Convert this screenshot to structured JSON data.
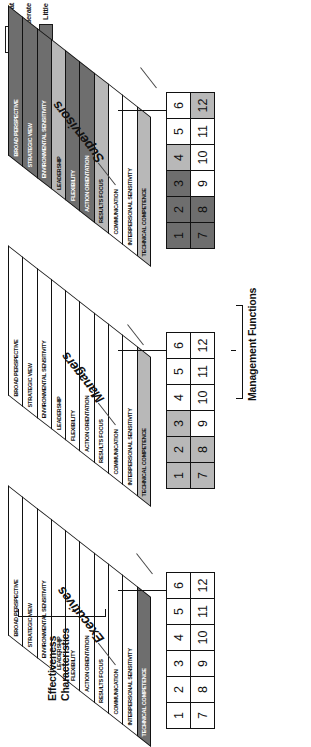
{
  "figure": {
    "effectiveness_label_line1": "Effectiveness",
    "effectiveness_label_line2": "Characteristics",
    "management_functions_label": "Management Functions"
  },
  "legend": {
    "title": "",
    "items": [
      {
        "label": "Great",
        "color": "#ffffff",
        "level": "great"
      },
      {
        "label": "Moderate",
        "color": "#b8b8b8",
        "level": "moderate"
      },
      {
        "label": "Little",
        "color": "#6e6e6e",
        "level": "little"
      }
    ]
  },
  "characteristics": [
    "BROAD PERSPECTIVE",
    "STRATEGIC VIEW",
    "ENVIRONMENTAL SENSITIVITY",
    "LEADERSHIP",
    "FLEXIBILITY",
    "ACTION ORIENTATION",
    "RESULTS FOCUS",
    "COMMUNICATION",
    "INTERPERSONAL SENSITIVITY",
    "TECHNICAL COMPETENCE"
  ],
  "grid_numbers": [
    [
      1,
      2,
      3,
      4,
      5,
      6
    ],
    [
      7,
      8,
      9,
      10,
      11,
      12
    ]
  ],
  "panels": [
    {
      "id": "executives",
      "title": "Executives",
      "band_levels": [
        "great",
        "great",
        "great",
        "great",
        "great",
        "great",
        "great",
        "great",
        "great",
        "little"
      ],
      "grid_levels": [
        [
          "great",
          "great",
          "great",
          "great",
          "great",
          "great"
        ],
        [
          "great",
          "great",
          "great",
          "great",
          "great",
          "great"
        ]
      ]
    },
    {
      "id": "managers",
      "title": "Managers",
      "band_levels": [
        "great",
        "great",
        "great",
        "great",
        "great",
        "great",
        "great",
        "great",
        "great",
        "moderate"
      ],
      "grid_levels": [
        [
          "moderate",
          "moderate",
          "moderate",
          "great",
          "great",
          "great"
        ],
        [
          "moderate",
          "moderate",
          "great",
          "great",
          "great",
          "great"
        ]
      ]
    },
    {
      "id": "supervisors",
      "title": "Supervisors",
      "band_levels": [
        "little",
        "little",
        "little",
        "moderate",
        "little",
        "little",
        "moderate",
        "great",
        "great",
        "moderate"
      ],
      "grid_levels": [
        [
          "little",
          "little",
          "little",
          "moderate",
          "great",
          "great"
        ],
        [
          "little",
          "little",
          "great",
          "great",
          "great",
          "moderate"
        ]
      ]
    }
  ]
}
